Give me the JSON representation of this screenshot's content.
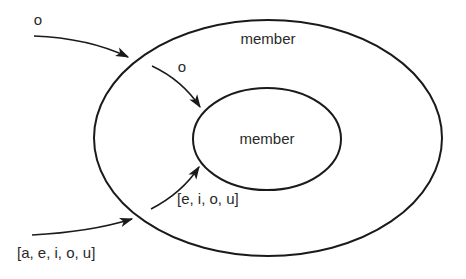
{
  "diagram": {
    "type": "nested-sets",
    "outer_set": {
      "label": "member"
    },
    "inner_set": {
      "label": "member"
    },
    "arrows": [
      {
        "label": "o",
        "from": "outside",
        "to": "outer_set"
      },
      {
        "label": "o",
        "from": "outer_set",
        "to": "inner_set"
      },
      {
        "label": "[a, e, i, o, u]",
        "from": "outside",
        "to": "outer_set"
      },
      {
        "label": "[e, i, o, u]",
        "from": "outer_set",
        "to": "inner_set"
      }
    ]
  }
}
